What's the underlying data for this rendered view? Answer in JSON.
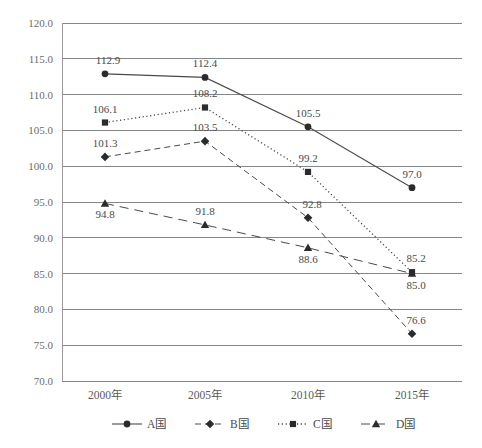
{
  "chart_data": {
    "type": "line",
    "title": "",
    "subtitle": "",
    "xlabel": "",
    "ylabel": "",
    "categories": [
      "2000年",
      "2005年",
      "2010年",
      "2015年"
    ],
    "ylim": [
      70.0,
      120.0
    ],
    "ytick_step": 5.0,
    "yticks": [
      "120.0",
      "115.0",
      "110.0",
      "105.0",
      "100.0",
      "95.0",
      "90.0",
      "85.0",
      "80.0",
      "75.0",
      "70.0"
    ],
    "grid": true,
    "legend_position": "bottom",
    "series": [
      {
        "name": "A国",
        "marker": "circle",
        "line_style": "solid",
        "color": "#4a4a4a",
        "values": [
          112.9,
          112.4,
          105.5,
          97.0
        ],
        "labels": [
          "112.9",
          "112.4",
          "105.5",
          "97.0"
        ]
      },
      {
        "name": "B国",
        "marker": "diamond",
        "line_style": "dashed",
        "color": "#4a4a4a",
        "values": [
          101.3,
          103.5,
          92.8,
          76.6
        ],
        "labels": [
          "101.3",
          "103.5",
          "92.8",
          "76.6"
        ]
      },
      {
        "name": "C国",
        "marker": "square",
        "line_style": "dotted",
        "color": "#4a4a4a",
        "values": [
          106.1,
          108.2,
          99.2,
          85.2
        ],
        "labels": [
          "106.1",
          "108.2",
          "99.2",
          "85.2"
        ]
      },
      {
        "name": "D国",
        "marker": "triangle",
        "line_style": "longdash",
        "color": "#4a4a4a",
        "values": [
          94.8,
          91.8,
          88.6,
          85.0
        ],
        "labels": [
          "94.8",
          "91.8",
          "88.6",
          "85.0"
        ]
      }
    ]
  },
  "legend": {
    "items": [
      {
        "label": "A国"
      },
      {
        "label": "B国"
      },
      {
        "label": "C国"
      },
      {
        "label": "D国"
      }
    ]
  }
}
